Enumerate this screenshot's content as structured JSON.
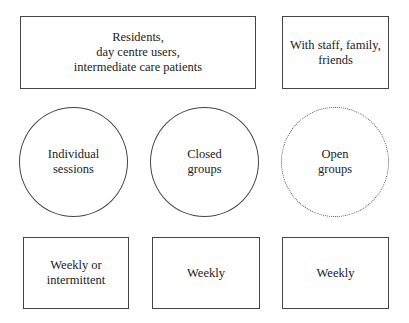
{
  "diagram": {
    "top_row": [
      {
        "id": "participants",
        "shape": "rectangle",
        "label": "Residents,\nday centre users,\nintermediate care patients"
      },
      {
        "id": "others",
        "shape": "rectangle",
        "label": "With staff, family,\nfriends"
      }
    ],
    "middle_row": [
      {
        "id": "individual",
        "shape": "circle",
        "border": "solid",
        "label": "Individual\nsessions"
      },
      {
        "id": "closed",
        "shape": "circle",
        "border": "solid",
        "label": "Closed\ngroups"
      },
      {
        "id": "open",
        "shape": "circle",
        "border": "dotted",
        "label": "Open\ngroups"
      }
    ],
    "bottom_row": [
      {
        "id": "freq-individual",
        "shape": "rectangle",
        "label": "Weekly or\nintermittent"
      },
      {
        "id": "freq-closed",
        "shape": "rectangle",
        "label": "Weekly"
      },
      {
        "id": "freq-open",
        "shape": "rectangle",
        "label": "Weekly"
      }
    ],
    "colors": {
      "stroke": "#444444",
      "text": "#222222",
      "background": "#ffffff"
    }
  }
}
